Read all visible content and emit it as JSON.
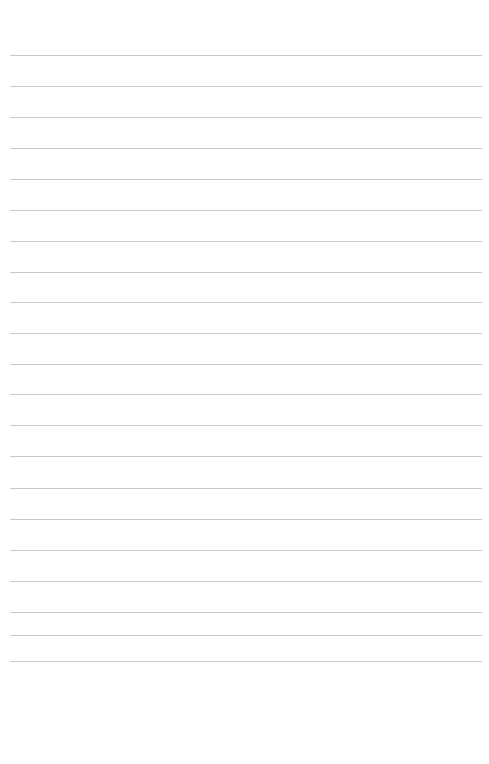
{
  "page": {
    "type": "blank lined notepaper",
    "background_color": "#ffffff",
    "line_color": "#c9c9c9",
    "line_count": 21,
    "line_positions_y": [
      55,
      86,
      117,
      148,
      179,
      210,
      241,
      272,
      302,
      333,
      364,
      394,
      425,
      456,
      488,
      519,
      550,
      581,
      612,
      635,
      661
    ],
    "line_left_x": 10,
    "line_width": 472,
    "text_lines": []
  }
}
